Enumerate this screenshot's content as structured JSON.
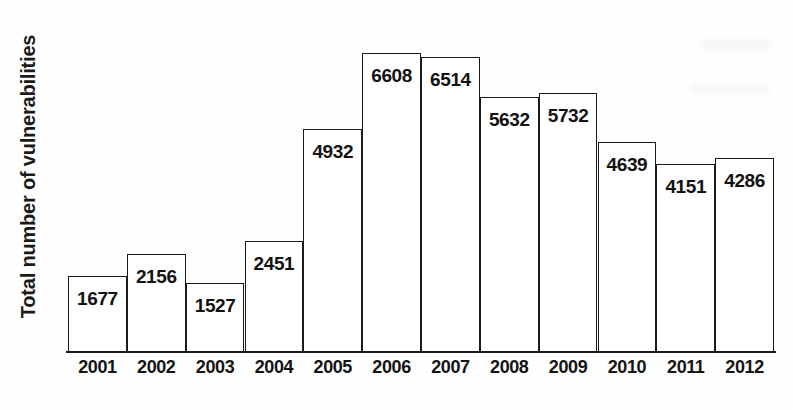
{
  "chart_data": {
    "type": "bar",
    "title": "",
    "subtitle": "",
    "xlabel": "",
    "ylabel": "Total number of vulnerabilities",
    "categories": [
      "2001",
      "2002",
      "2003",
      "2004",
      "2005",
      "2006",
      "2007",
      "2008",
      "2009",
      "2010",
      "2011",
      "2012"
    ],
    "values": [
      1677,
      2156,
      1527,
      2451,
      4932,
      6608,
      6514,
      5632,
      5732,
      4639,
      4151,
      4286
    ],
    "value_labels": [
      "1677",
      "2156",
      "1527",
      "2451",
      "4932",
      "6608",
      "6514",
      "5632",
      "5732",
      "4639",
      "4151",
      "4286"
    ],
    "ylim": [
      0,
      6608
    ],
    "grid": false,
    "legend": false,
    "legend_position": "none",
    "bar_fill_color": "#ffffff",
    "bar_outline_color": "#1b1b1b",
    "label_color": "#121212",
    "background_color": "#fefefe",
    "axis_color": "#1b1b1b",
    "value_label_placement": "inside-top"
  },
  "axes": {
    "y_title": "Total number of vulnerabilities"
  }
}
